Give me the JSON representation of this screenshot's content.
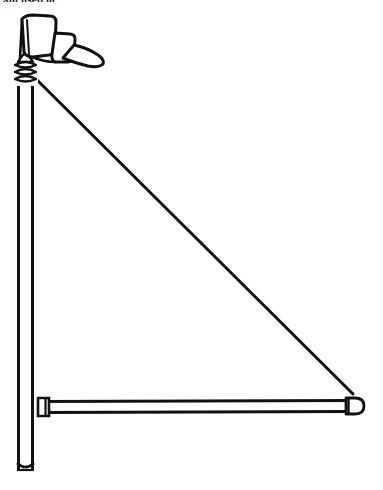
{
  "image": {
    "title": "Flagpole mast with weather-vane finial, horizontal boom and diagonal stay",
    "subject": "line-art technical drawing",
    "style": "black ink outline on white background",
    "width": 383,
    "height": 490,
    "background_color": "#ffffff",
    "ink_color": "#111111"
  },
  "caption": {
    "text": "am used of",
    "note": "partially cropped text fragment at very top edge of image"
  },
  "parts": [
    {
      "id": "vane",
      "name": "weather-vane-flag",
      "label": "Flag / vane blade",
      "description": "Rectangular banner-like blade at the top of the mast with a tapered tail sweeping to the right"
    },
    {
      "id": "collar",
      "name": "pole-collar-rings",
      "label": "Collar rings",
      "description": "Three stacked bands forming a collar just below the vane where the stay attaches",
      "ring_count": 3
    },
    {
      "id": "mast",
      "name": "vertical-mast",
      "label": "Vertical mast / pole",
      "description": "Tall vertical tube running the full height, open flat bottom"
    },
    {
      "id": "boom",
      "name": "horizontal-boom",
      "label": "Horizontal boom",
      "description": "Slender horizontal tube attached near the foot of the mast, rounded cap at the far right end"
    },
    {
      "id": "stay",
      "name": "diagonal-stay",
      "label": "Diagonal stay / brace",
      "description": "Straight thin line from the collar down-right to the outer end of the boom"
    }
  ],
  "geometry": {
    "mast": {
      "x_left": 17,
      "x_right": 33,
      "y_top": 62,
      "y_bottom": 472
    },
    "collar": {
      "x": 14,
      "y": 57,
      "width": 24,
      "height": 26
    },
    "vane": {
      "x": 18,
      "y": 16,
      "width": 88,
      "height": 50
    },
    "boom": {
      "x_left": 40,
      "x_right": 362,
      "y_top": 398,
      "height": 16
    },
    "stay": {
      "x1": 34,
      "y1": 78,
      "x2": 352,
      "y2": 394
    }
  }
}
